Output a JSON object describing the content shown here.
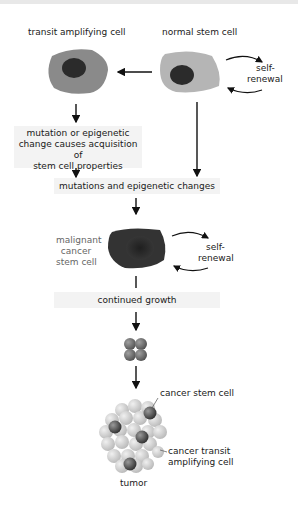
{
  "diagram": {
    "labels": {
      "transit_amplifying_cell": "transit amplifying cell",
      "normal_stem_cell": "normal stem cell",
      "self_renewal_1_line1": "self-",
      "self_renewal_1_line2": "renewal",
      "mutation_box_line1": "mutation or epigenetic",
      "mutation_box_line2": "change causes acquisition of",
      "mutation_box_line3": "stem cell properties",
      "mutations_changes": "mutations and epigenetic changes",
      "malignant_line1": "malignant",
      "malignant_line2": "cancer",
      "malignant_line3": "stem cell",
      "self_renewal_2_line1": "self-",
      "self_renewal_2_line2": "renewal",
      "continued_growth": "continued growth",
      "cancer_stem_cell": "cancer stem cell",
      "cancer_transit_line1": "cancer transit",
      "cancer_transit_line2": "amplifying cell",
      "tumor": "tumor"
    },
    "colors": {
      "transit_cell_fill": "#8a8a8a",
      "normal_cell_fill": "#b5b5b5",
      "nucleus_fill": "#2b2b2b",
      "malignant_cell_fill": "#333333",
      "tumor_light_cell": "#d6d6d6",
      "tumor_dark_cell": "#4a4a4a",
      "arrow": "#111111",
      "box_bg": "#f3f3f3"
    }
  }
}
